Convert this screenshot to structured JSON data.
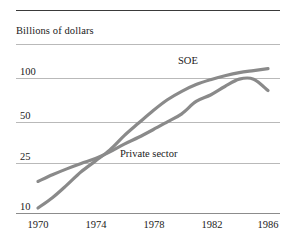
{
  "figure": {
    "axis_title": "Billions of dollars",
    "top_rule": true
  },
  "chart_data": {
    "type": "line",
    "title": "",
    "subtitle": "",
    "xlabel": "",
    "ylabel": "Billions of dollars",
    "yscale": "log",
    "ylim": [
      8,
      140
    ],
    "xlim": [
      1970,
      1986
    ],
    "grid": "horizontal",
    "legend_position": "inline-labels",
    "ytick_labels": [
      "10",
      "25",
      "50",
      "100"
    ],
    "ytick_values": [
      10,
      25,
      50,
      100
    ],
    "xtick_labels": [
      "1970",
      "1974",
      "1978",
      "1982",
      "1986"
    ],
    "xtick_values": [
      1970,
      1974,
      1978,
      1982,
      1986
    ],
    "x": [
      1970,
      1971,
      1972,
      1973,
      1974,
      1975,
      1976,
      1977,
      1978,
      1979,
      1980,
      1981,
      1982,
      1983,
      1984,
      1985,
      1986
    ],
    "series": [
      {
        "name": "SOE",
        "color": "#8a8a8a",
        "values": [
          10,
          12,
          15,
          19,
          23,
          28,
          36,
          45,
          56,
          68,
          79,
          89,
          97,
          104,
          110,
          114,
          118
        ]
      },
      {
        "name": "Private sector",
        "color": "#8a8a8a",
        "values": [
          16,
          18,
          20,
          22,
          24,
          27,
          31,
          35,
          40,
          46,
          53,
          66,
          74,
          86,
          98,
          98,
          80
        ]
      }
    ],
    "annotations": [
      {
        "text": "SOE",
        "x": 1981,
        "y": 118
      },
      {
        "text": "Private sector",
        "x": 1976,
        "y": 30
      }
    ]
  },
  "colors": {
    "line": "#8a8a8a",
    "gridline": "#b9b9b9",
    "rule": "#3a3a3a",
    "text": "#1a1a1a",
    "background": "#ffffff"
  }
}
